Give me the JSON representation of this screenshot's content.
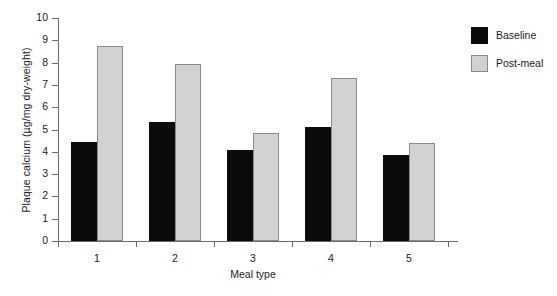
{
  "chart_data": {
    "type": "bar",
    "title": "",
    "subtitle": "",
    "xlabel": "Meal type",
    "ylabel": "Plaque calcium (µg/mg dry-weight)",
    "categories": [
      "1",
      "2",
      "3",
      "4",
      "5"
    ],
    "series": [
      {
        "name": "Baseline",
        "color": "#0b0b0b",
        "values": [
          4.45,
          5.35,
          4.1,
          5.1,
          3.85
        ]
      },
      {
        "name": "Post-meal",
        "color": "#d2d2d2",
        "values": [
          8.75,
          7.95,
          4.85,
          7.3,
          4.4
        ]
      }
    ],
    "ylim": [
      0,
      10
    ],
    "yticks": [
      "0",
      "1",
      "2",
      "3",
      "4",
      "5",
      "6",
      "7",
      "8",
      "9",
      "10"
    ],
    "grid": false,
    "legend_position": "right"
  },
  "legend": {
    "items": [
      {
        "label": "Baseline",
        "swatch": "black-square-swatch"
      },
      {
        "label": "Post-meal",
        "swatch": "gray-square-swatch"
      }
    ]
  }
}
